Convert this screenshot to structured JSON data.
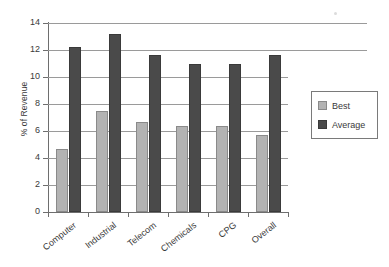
{
  "chart_data": {
    "type": "bar",
    "title": "",
    "xlabel": "",
    "ylabel": "% of Revenue",
    "ylim": [
      0,
      14
    ],
    "yticks": [
      0,
      2,
      4,
      6,
      8,
      10,
      12,
      14
    ],
    "grid": true,
    "legend_position": "right",
    "categories": [
      "Computer",
      "Industrial",
      "Telecom",
      "Chemicals",
      "CPG",
      "Overall"
    ],
    "series": [
      {
        "name": "Best",
        "color": "#b3b3b3",
        "values": [
          4.7,
          7.5,
          6.7,
          6.4,
          6.4,
          5.7
        ]
      },
      {
        "name": "Average",
        "color": "#4a4a4a",
        "values": [
          12.2,
          13.2,
          11.6,
          11.0,
          11.0,
          11.6
        ]
      }
    ]
  },
  "axis": {
    "y_title": "% of Revenue",
    "y_tick_labels": [
      "14",
      "12",
      "10",
      "8",
      "6",
      "4",
      "2",
      "0"
    ]
  },
  "legend": {
    "entries": [
      {
        "label": "Best"
      },
      {
        "label": "Average"
      }
    ]
  }
}
